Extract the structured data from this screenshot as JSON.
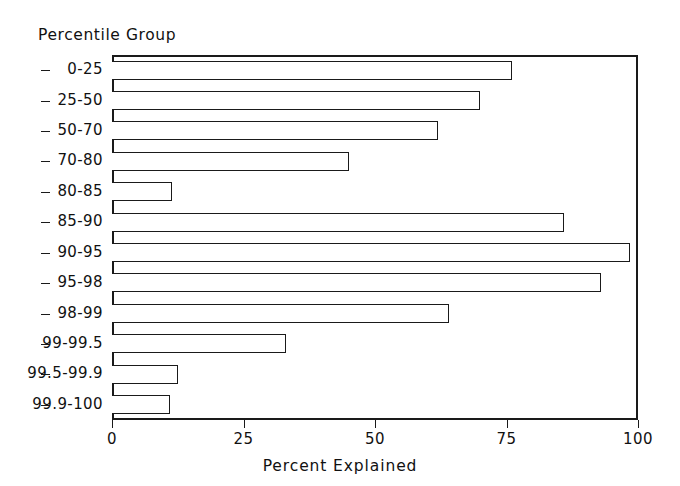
{
  "chart_data": {
    "type": "bar",
    "orientation": "horizontal",
    "title": "",
    "xlabel": "Percent Explained",
    "ylabel": "Percentile Group",
    "xlim": [
      0,
      100
    ],
    "xticks": [
      0,
      25,
      50,
      75,
      100
    ],
    "xtick_labels": [
      "0",
      "25",
      "50",
      "75",
      "100"
    ],
    "grid": false,
    "legend": null,
    "categories": [
      "0-25",
      "25-50",
      "50-70",
      "70-80",
      "80-85",
      "85-90",
      "90-95",
      "95-98",
      "98-99",
      "99-99.5",
      "99.5-99.9",
      "99.9-100"
    ],
    "values": [
      76,
      70,
      62,
      45,
      11.5,
      86,
      98.5,
      93,
      64,
      33,
      12.5,
      11
    ],
    "bar_style": {
      "fill": "#ffffff",
      "edge": "#1a1a1a"
    }
  },
  "axes": {
    "y_title": "Percentile Group",
    "x_title": "Percent Explained"
  }
}
